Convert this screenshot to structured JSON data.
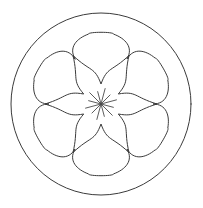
{
  "figure": {
    "title": "Geometric rosette line drawing",
    "background_color": "#ffffff",
    "stroke_color": "#3b3b3b",
    "stroke_width": 1,
    "width": 203,
    "height": 208,
    "center": {
      "x": 101,
      "y": 104
    },
    "elements": [
      {
        "name": "outer-circle",
        "shape": "circle",
        "radius_x": 90,
        "radius_y": 91,
        "description": "Large enclosing circle"
      },
      {
        "name": "rosette-outline",
        "shape": "six-lobed-rosette",
        "lobe_count": 6,
        "outer_radius": 71,
        "inner_radius": 52,
        "description": "Six rounded-square lobes forming a flower outline"
      },
      {
        "name": "six-point-star",
        "shape": "star",
        "point_count": 6,
        "tip_radius": 56,
        "waist_radius": 20,
        "concave": true,
        "description": "Six pointed star with concave curved arms"
      },
      {
        "name": "center-spokes",
        "shape": "radial-lines",
        "spoke_count": 12,
        "spoke_length": 16,
        "description": "Short radiating lines at the center hub"
      }
    ]
  }
}
